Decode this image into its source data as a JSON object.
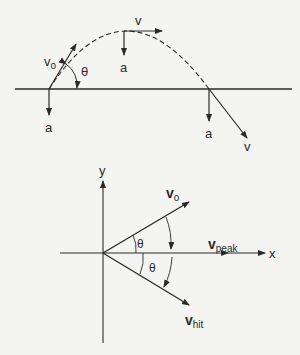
{
  "top_diagram": {
    "labels": {
      "v0_launch": "v",
      "v0_sub": "o",
      "theta": "θ",
      "v_peak": "v",
      "a_peak": "a",
      "a_launch": "a",
      "a_land": "a",
      "v_land": "v"
    }
  },
  "bottom_diagram": {
    "axis_x": "x",
    "axis_y": "y",
    "v0": "v",
    "v0_sub": "o",
    "vpeak": "v",
    "vpeak_sub": "peak",
    "vhit": "v",
    "vhit_sub": "hit",
    "theta_upper": "θ",
    "theta_lower": "θ"
  },
  "colors": {
    "stroke": "#2a2a2a",
    "background": "#f4f4f2"
  }
}
